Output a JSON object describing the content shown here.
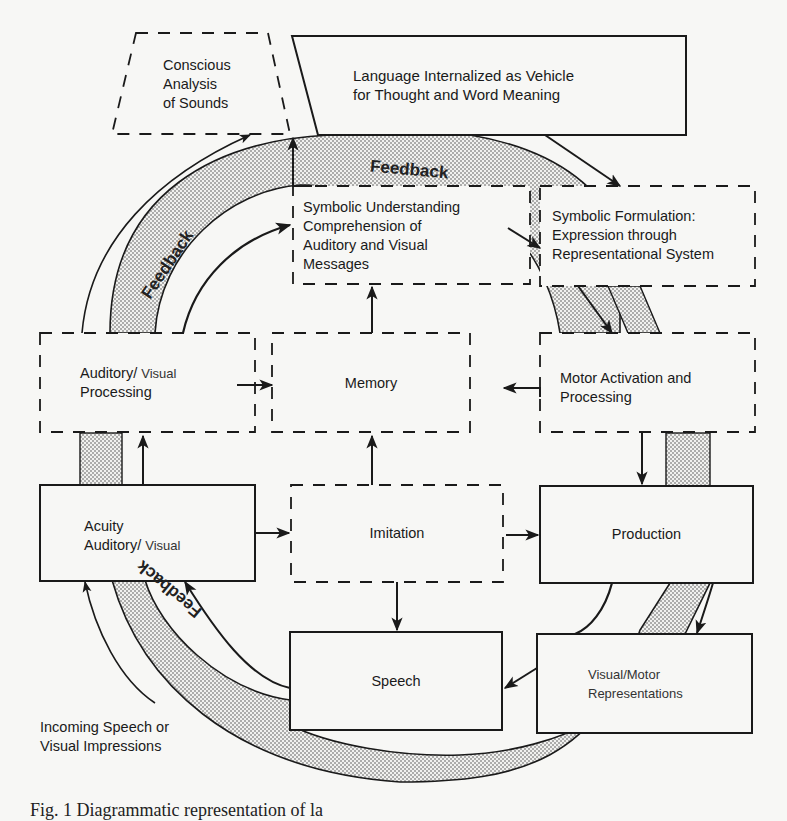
{
  "figure": {
    "caption": "Fig. 1 Diagrammatic representation of la",
    "feedback_label": "Feedback",
    "colors": {
      "ink": "#1a1a1a",
      "paper": "#f7f7f5",
      "stipple": "#bdbdbd"
    }
  },
  "nodes": {
    "conscious_analysis": {
      "lines": [
        "Conscious",
        "Analysis",
        "of Sounds"
      ],
      "style": "dashed"
    },
    "language_internalized": {
      "lines": [
        "Language Internalized as Vehicle",
        "for Thought and Word Meaning"
      ],
      "style": "solid"
    },
    "symbolic_understanding": {
      "lines": [
        "Symbolic Understanding",
        "Comprehension of",
        "Auditory and Visual",
        "Messages"
      ],
      "style": "dashed"
    },
    "symbolic_formulation": {
      "lines": [
        "Symbolic Formulation:",
        "Expression through",
        "Representational System"
      ],
      "style": "dashed"
    },
    "auditory_processing": {
      "line1_main": "Auditory/",
      "line1_light": "Visual",
      "line2": "Processing",
      "style": "dashed"
    },
    "memory": {
      "lines": [
        "Memory"
      ],
      "style": "dashed"
    },
    "motor_activation": {
      "lines": [
        "Motor Activation and",
        "Processing"
      ],
      "style": "dashed"
    },
    "acuity": {
      "line1": "Acuity",
      "line2_main": "Auditory/",
      "line2_light": "Visual",
      "style": "solid"
    },
    "imitation": {
      "lines": [
        "Imitation"
      ],
      "style": "dashed"
    },
    "production": {
      "lines": [
        "Production"
      ],
      "style": "solid"
    },
    "speech": {
      "lines": [
        "Speech"
      ],
      "style": "solid"
    },
    "visual_motor": {
      "lines": [
        "Visual/Motor",
        "Representations"
      ],
      "style": "solid"
    }
  },
  "annotations": {
    "incoming": {
      "lines": [
        "Incoming Speech or",
        "Visual Impressions"
      ]
    }
  },
  "feedback_bands": [
    {
      "position": "top",
      "label": "Feedback"
    },
    {
      "position": "left",
      "label": "Feedback"
    },
    {
      "position": "bottom-left",
      "label": "Feedback"
    }
  ]
}
